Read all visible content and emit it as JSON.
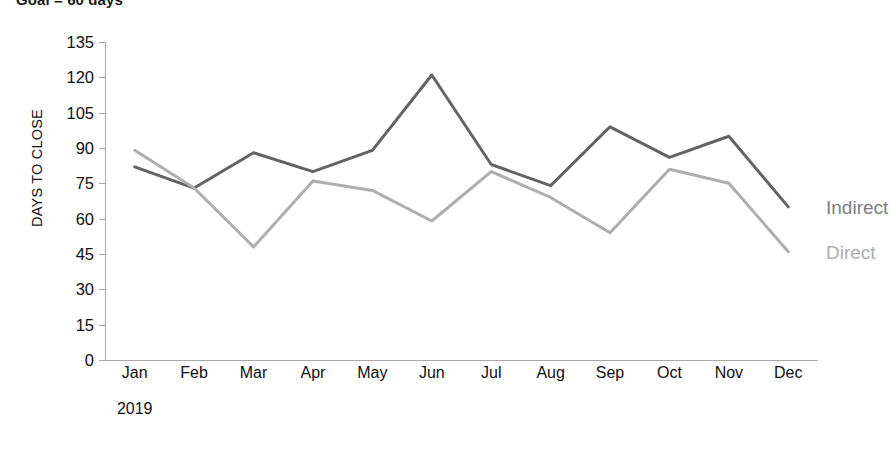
{
  "caption": "Goal = 60 days",
  "chart_data": {
    "type": "line",
    "title": "Goal = 60 days",
    "xlabel": "2019",
    "ylabel": "DAYS TO CLOSE",
    "categories": [
      "Jan",
      "Feb",
      "Mar",
      "Apr",
      "May",
      "Jun",
      "Jul",
      "Aug",
      "Sep",
      "Oct",
      "Nov",
      "Dec"
    ],
    "yticks": [
      0,
      15,
      30,
      45,
      60,
      75,
      90,
      105,
      120,
      135
    ],
    "ylim": [
      0,
      135
    ],
    "grid": false,
    "legend_position": "right-inline",
    "series": [
      {
        "name": "Indirect",
        "color": "#636363",
        "values": [
          82,
          73,
          88,
          80,
          89,
          121,
          83,
          74,
          99,
          86,
          95,
          65
        ]
      },
      {
        "name": "Direct",
        "color": "#aeaeae",
        "values": [
          89,
          73,
          48,
          76,
          72,
          59,
          80,
          69,
          54,
          81,
          75,
          46
        ]
      }
    ]
  },
  "axis": {
    "y_title": "DAYS TO CLOSE",
    "x_year": "2019"
  },
  "legend": {
    "indirect": "Indirect",
    "direct": "Direct"
  }
}
